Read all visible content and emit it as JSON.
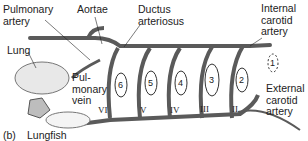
{
  "diagram": {
    "title_caption": {
      "panel": "(b)",
      "name": "Lungfish"
    },
    "labels": {
      "pulmonary_artery": "Pulmonary\nartery",
      "aortae": "Aortae",
      "ductus_arteriosus": "Ductus\narteriosus",
      "internal_carotid": "Internal\ncarotid\nartery",
      "lung": "Lung",
      "pulmonary_vein": "Pul-\nmonary\nvein",
      "external_carotid": "External\ncarotid\nartery"
    },
    "gill_numbers": [
      "1",
      "2",
      "3",
      "4",
      "5",
      "6"
    ],
    "arch_numerals": [
      "II",
      "III",
      "IV",
      "V",
      "VI"
    ],
    "colors": {
      "vessel": "#6b6b6b",
      "vessel_edge": "#3a3a3a",
      "lung": "#e8e8e8",
      "heart": "#bdbdbd",
      "text": "#222222"
    }
  }
}
